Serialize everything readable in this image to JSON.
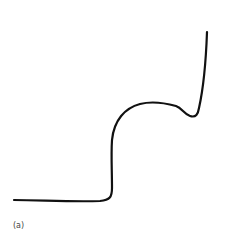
{
  "figure": {
    "caption": "(a)",
    "stroke_color": "#111111",
    "background": "#ffffff",
    "curve": {
      "description": "hand-drawn curve: flat baseline, steep rise, rounded shoulder plateau with small dip, then sharp vertical rise",
      "path": "M 14 200 C 40 200, 70 202, 100 201 C 110 200, 112 197, 112 188 C 112 170, 111 155, 112 140 C 114 120, 125 108, 140 104 C 152 101, 165 103, 176 106 C 182 108, 184 114, 190 116 C 196 118, 198 114, 199 108 C 203 90, 206 60, 207 32"
    }
  }
}
